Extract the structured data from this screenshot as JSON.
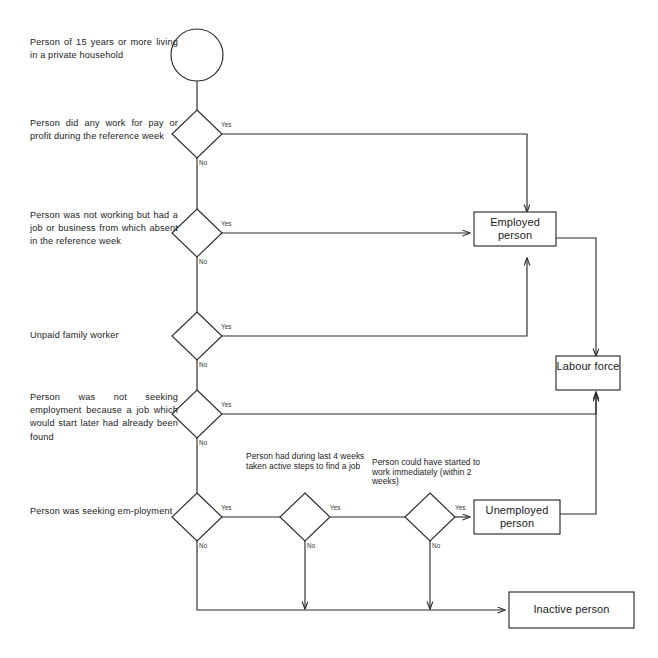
{
  "diagram": {
    "colors": {
      "stroke": "#2b2b2b",
      "background": "#ffffff",
      "text": "#222222"
    },
    "start_node": {
      "shape": "circle",
      "label": ""
    },
    "questions": [
      {
        "id": "q1",
        "text": "Person of 15 years or more living in a private household",
        "shape": "text-only"
      },
      {
        "id": "q2",
        "text": "Person did any work for pay or profit during the reference week",
        "yes": "Yes",
        "no": "No"
      },
      {
        "id": "q3",
        "text": "Person was not working but had a job or business from which absent in the reference week",
        "yes": "Yes",
        "no": "No"
      },
      {
        "id": "q4",
        "text": "Unpaid family worker",
        "yes": "Yes",
        "no": "No"
      },
      {
        "id": "q5",
        "text": "Person was not seeking employment because a job which would start later had already been found",
        "yes": "Yes",
        "no": "No"
      },
      {
        "id": "q6",
        "text": "Person was seeking em-ployment",
        "yes": "Yes",
        "no": "No"
      }
    ],
    "mid_questions": [
      {
        "id": "q7",
        "text": "Person had during last 4 weeks taken active steps to find a job",
        "yes": "Yes",
        "no": "No"
      },
      {
        "id": "q8",
        "text": "Person could have started to work immediately (within 2 weeks)",
        "yes": "Yes",
        "no": "No"
      }
    ],
    "outcomes": [
      {
        "id": "employed",
        "label": "Employed person"
      },
      {
        "id": "labour-force",
        "label": "Labour force"
      },
      {
        "id": "unemployed",
        "label": "Unemployed person"
      },
      {
        "id": "inactive",
        "label": "Inactive person"
      }
    ]
  }
}
